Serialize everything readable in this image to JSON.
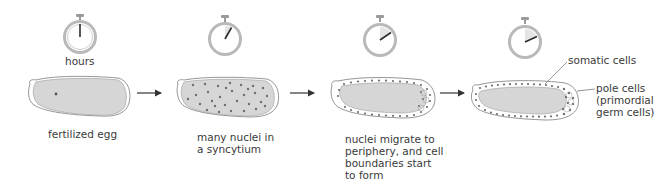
{
  "diagram": {
    "colors": {
      "cytoplasm": "#d6d6d6",
      "outline": "#8a8a8a",
      "nucleus": "#707070",
      "stopwatch_ring": "#b9b9b9",
      "stopwatch_shade": "#e4e4e4",
      "hand": "#2b2b2b",
      "arrow": "#333333",
      "text": "#3a3a3a"
    },
    "timer_unit_label": "hours",
    "stages": [
      {
        "id": "stage-1",
        "label": "fertilized egg",
        "timer_fraction": 0.0,
        "description": "single nucleus"
      },
      {
        "id": "stage-2",
        "label": "many nuclei in\na syncytium",
        "timer_fraction": 0.08,
        "description": "nuclei scattered through cytoplasm"
      },
      {
        "id": "stage-3",
        "label": "nuclei migrate to\nperiphery, and cell\nboundaries start\nto form",
        "timer_fraction": 0.16,
        "description": "nuclei at cortex"
      },
      {
        "id": "stage-4",
        "label": "",
        "timer_fraction": 0.18,
        "description": "cellular blastoderm"
      }
    ],
    "callouts": [
      {
        "id": "somatic",
        "text": "somatic cells"
      },
      {
        "id": "pole",
        "text": "pole cells\n(primordial\ngerm cells)"
      }
    ],
    "arrows": [
      {
        "from": "stage-1",
        "to": "stage-2"
      },
      {
        "from": "stage-2",
        "to": "stage-3"
      },
      {
        "from": "stage-3",
        "to": "stage-4"
      }
    ]
  }
}
